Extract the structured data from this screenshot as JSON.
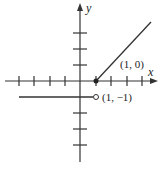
{
  "figure": {
    "x_axis_label": "x",
    "y_axis_label": "y",
    "points": [
      {
        "label": "(1, 0)",
        "type": "closed"
      },
      {
        "label": "(1, −1)",
        "type": "open"
      }
    ],
    "pieces": [
      {
        "description": "y = -1 for x < 1",
        "style": "horizontal ray"
      },
      {
        "description": "y = x - 1 for x >= 1",
        "style": "diagonal ray"
      }
    ],
    "tick_spacing_units": 1,
    "colors": {
      "line": "#333333",
      "background": "#ffffff"
    }
  }
}
